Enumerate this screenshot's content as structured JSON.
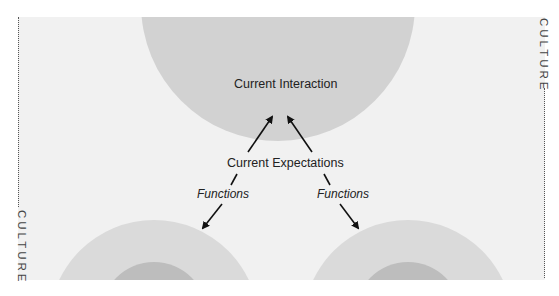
{
  "diagram": {
    "nodes": {
      "top_circle": {
        "label": "Current Interaction"
      },
      "center": {
        "label": "Current Expectations"
      },
      "bottom_left_circle": {
        "label": ""
      },
      "bottom_right_circle": {
        "label": ""
      }
    },
    "edge_labels": {
      "left": "Functions",
      "right": "Functions"
    },
    "side_labels": {
      "left": "CULTURE",
      "right": "CULTURE"
    },
    "colors": {
      "panel_bg": "#f1f1f1",
      "top_circle": "#d2d2d2",
      "outer_ring": "#dadada",
      "inner_circle": "#bdbdbd",
      "arrow": "#111111"
    }
  }
}
